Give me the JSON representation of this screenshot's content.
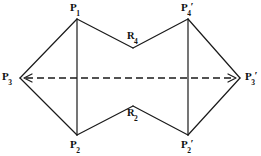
{
  "figure": {
    "kind": "geometric-diagram",
    "width": 261,
    "height": 156,
    "background_color": "#ffffff",
    "stroke_color": "#1a1a1a",
    "stroke_width": 1.1,
    "dashed_axis_color": "#1a1a1a"
  },
  "vertices": [
    {
      "id": "P1",
      "base": "P",
      "sub": "1",
      "prime": "",
      "x": 77,
      "y": 19,
      "label_x": 70,
      "label_y": 3
    },
    {
      "id": "P2",
      "base": "P",
      "sub": "2",
      "prime": "",
      "x": 77,
      "y": 135,
      "label_x": 70,
      "label_y": 140
    },
    {
      "id": "P3",
      "base": "P",
      "sub": "3",
      "prime": "",
      "x": 20,
      "y": 78,
      "label_x": 2,
      "label_y": 72
    },
    {
      "id": "P3p",
      "base": "P",
      "sub": "3",
      "prime": "′",
      "x": 240,
      "y": 78,
      "label_x": 244,
      "label_y": 72
    },
    {
      "id": "P4p",
      "base": "P",
      "sub": "4",
      "prime": "′",
      "x": 188,
      "y": 19,
      "label_x": 181,
      "label_y": 3
    },
    {
      "id": "P2p",
      "base": "P",
      "sub": "2",
      "prime": "′",
      "x": 188,
      "y": 135,
      "label_x": 181,
      "label_y": 140
    },
    {
      "id": "R4",
      "base": "R",
      "sub": "4",
      "prime": "",
      "x": 133,
      "y": 48,
      "label_x": 126,
      "label_y": 31
    },
    {
      "id": "R2",
      "base": "R",
      "sub": "2",
      "prime": "",
      "x": 133,
      "y": 106,
      "label_x": 126,
      "label_y": 108
    }
  ],
  "edges": [
    {
      "name": "P3-P1",
      "from": "P3",
      "to": "P1",
      "style": "solid"
    },
    {
      "name": "P1-R4",
      "from": "P1",
      "to": "R4",
      "style": "solid"
    },
    {
      "name": "R4-P4p",
      "from": "R4",
      "to": "P4p",
      "style": "solid"
    },
    {
      "name": "P4p-P3p",
      "from": "P4p",
      "to": "P3p",
      "style": "solid"
    },
    {
      "name": "P3p-P2p",
      "from": "P3p",
      "to": "P2p",
      "style": "solid"
    },
    {
      "name": "P2p-R2",
      "from": "P2p",
      "to": "R2",
      "style": "solid"
    },
    {
      "name": "R2-P2",
      "from": "R2",
      "to": "P2",
      "style": "solid"
    },
    {
      "name": "P2-P3",
      "from": "P2",
      "to": "P3",
      "style": "solid"
    },
    {
      "name": "P1-P2",
      "from": "P1",
      "to": "P2",
      "style": "solid"
    },
    {
      "name": "P4p-P2p",
      "from": "P4p",
      "to": "P2p",
      "style": "solid"
    }
  ],
  "axis": {
    "name": "axis-of-symmetry",
    "style": "dashed",
    "x1": 24,
    "x2": 236,
    "y": 78,
    "dash_pattern": "7,4",
    "arrow_left": true,
    "arrow_right": true
  },
  "labels": {
    "P1": "P",
    "P2": "P",
    "P3": "P",
    "P3p": "P",
    "P4p": "P",
    "P2p": "P",
    "R4": "R",
    "R2": "R"
  }
}
